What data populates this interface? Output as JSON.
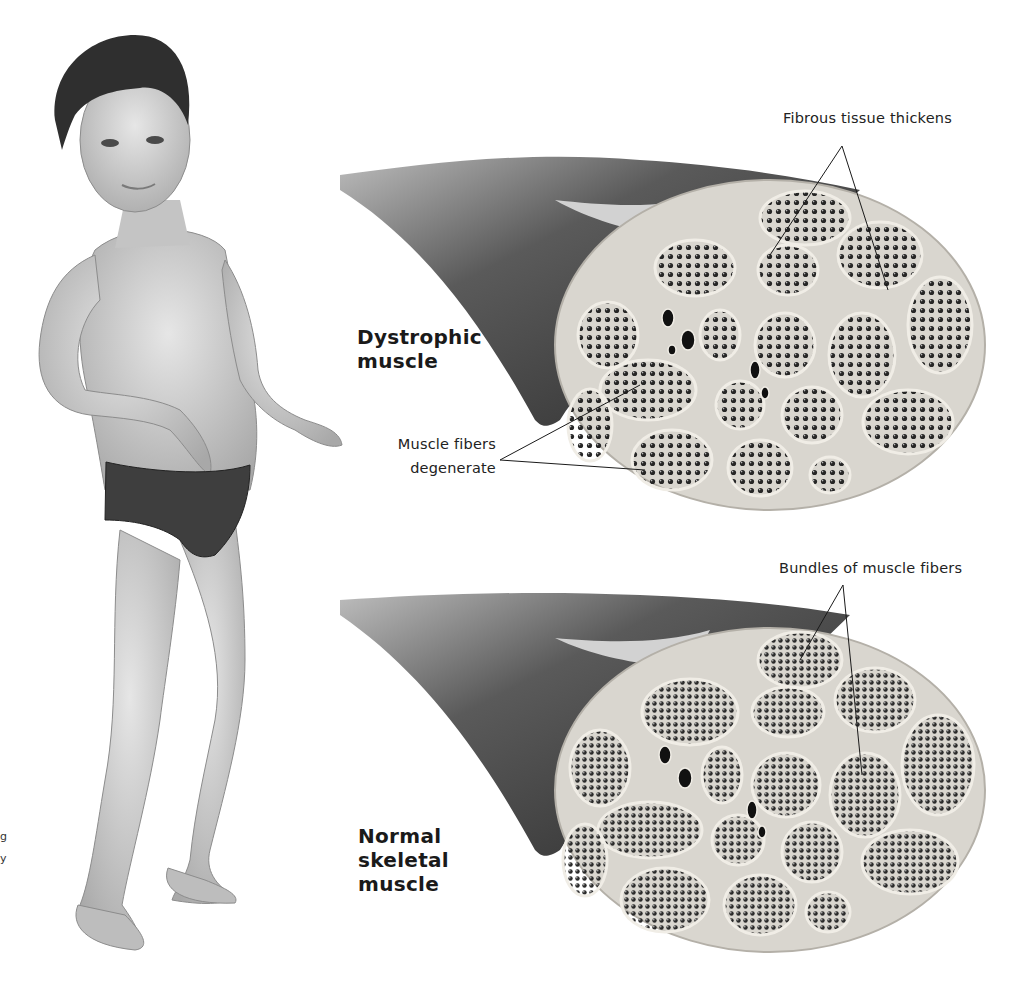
{
  "figure": {
    "palette": {
      "background": "#ffffff",
      "muscle_dark": "#3c3c3c",
      "tissue_light": "#d9d6cf",
      "bundle": "#4a4a4a",
      "text": "#1a1a1a"
    }
  },
  "panels": [
    {
      "title_lines": [
        "Dystrophic",
        "muscle"
      ],
      "callouts": {
        "top": "Fibrous tissue thickens",
        "left_line1": "Muscle fibers",
        "left_line2": "degenerate"
      }
    },
    {
      "title_lines": [
        "Normal",
        "skeletal",
        "muscle"
      ],
      "callouts": {
        "top": "Bundles of muscle fibers"
      }
    }
  ],
  "edge_fragments": [
    "g",
    "y"
  ]
}
